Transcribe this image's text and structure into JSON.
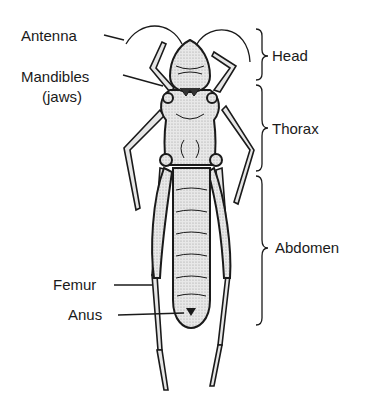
{
  "diagram": {
    "labels_left": {
      "antenna": "Antenna",
      "mandibles": "Mandibles",
      "mandibles_sub": "(jaws)",
      "femur": "Femur",
      "anus": "Anus"
    },
    "labels_right": {
      "head": "Head",
      "thorax": "Thorax",
      "abdomen": "Abdomen"
    },
    "colors": {
      "ink": "#1a1a1a",
      "body_shading": "#d9d9d9",
      "background": "#ffffff"
    }
  }
}
